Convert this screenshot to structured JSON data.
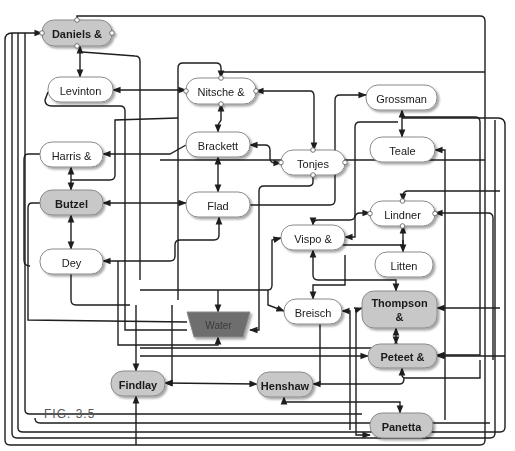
{
  "figure": {
    "caption": "Fig. 3.5",
    "caption_display": "FIG. 3.5"
  },
  "colors": {
    "node_fill_default": "#ffffff",
    "node_fill_highlight": "#c8c8c8",
    "node_fill_water": "#6e6e6e",
    "edge": "#1e1e1e",
    "node_stroke": "#8a8a8a"
  },
  "nodes": [
    {
      "id": "daniels",
      "label": "Daniels &",
      "x": 42,
      "y": 20,
      "w": 70,
      "h": 26,
      "style": "highlight",
      "ports": true
    },
    {
      "id": "levinton",
      "label": "Levinton",
      "x": 48,
      "y": 77,
      "w": 65,
      "h": 25,
      "style": "default"
    },
    {
      "id": "nitsche",
      "label": "Nitsche &",
      "x": 186,
      "y": 78,
      "w": 70,
      "h": 26,
      "style": "default",
      "ports": true
    },
    {
      "id": "grossman",
      "label": "Grossman",
      "x": 366,
      "y": 85,
      "w": 71,
      "h": 25,
      "style": "default"
    },
    {
      "id": "harris",
      "label": "Harris &",
      "x": 40,
      "y": 142,
      "w": 63,
      "h": 25,
      "style": "default"
    },
    {
      "id": "brackett",
      "label": "Brackett",
      "x": 186,
      "y": 132,
      "w": 64,
      "h": 25,
      "style": "default"
    },
    {
      "id": "tonjes",
      "label": "Tonjes",
      "x": 281,
      "y": 150,
      "w": 64,
      "h": 25,
      "style": "default",
      "ports": true
    },
    {
      "id": "teale",
      "label": "Teale",
      "x": 370,
      "y": 137,
      "w": 65,
      "h": 25,
      "style": "default"
    },
    {
      "id": "butzel",
      "label": "Butzel",
      "x": 40,
      "y": 190,
      "w": 63,
      "h": 25,
      "style": "highlight"
    },
    {
      "id": "flad",
      "label": "Flad",
      "x": 186,
      "y": 192,
      "w": 64,
      "h": 25,
      "style": "default"
    },
    {
      "id": "lindner",
      "label": "Lindner",
      "x": 370,
      "y": 201,
      "w": 65,
      "h": 25,
      "style": "default",
      "ports": true
    },
    {
      "id": "vispo",
      "label": "Vispo &",
      "x": 281,
      "y": 225,
      "w": 64,
      "h": 25,
      "style": "default"
    },
    {
      "id": "dey",
      "label": "Dey",
      "x": 40,
      "y": 249,
      "w": 63,
      "h": 25,
      "style": "default"
    },
    {
      "id": "litten",
      "label": "Litten",
      "x": 375,
      "y": 252,
      "w": 58,
      "h": 25,
      "style": "default"
    },
    {
      "id": "water",
      "label": "Water",
      "x": 187,
      "y": 312,
      "w": 63,
      "h": 25,
      "style": "water",
      "shape": "trapezoid"
    },
    {
      "id": "breisch",
      "label": "Breisch",
      "x": 284,
      "y": 299,
      "w": 58,
      "h": 25,
      "style": "default"
    },
    {
      "id": "thompson",
      "label": "Thompson",
      "label2": "&",
      "x": 362,
      "y": 291,
      "w": 75,
      "h": 37,
      "style": "highlight"
    },
    {
      "id": "peteet",
      "label": "Peteet &",
      "x": 368,
      "y": 344,
      "w": 69,
      "h": 24,
      "style": "highlight"
    },
    {
      "id": "findlay",
      "label": "Findlay",
      "x": 111,
      "y": 371,
      "w": 54,
      "h": 25,
      "style": "highlight"
    },
    {
      "id": "henshaw",
      "label": "Henshaw",
      "x": 257,
      "y": 372,
      "w": 56,
      "h": 25,
      "style": "highlight"
    },
    {
      "id": "panetta",
      "label": "Panetta",
      "x": 370,
      "y": 413,
      "w": 63,
      "h": 25,
      "style": "highlight"
    }
  ],
  "edges": [
    {
      "from": "daniels",
      "to": "levinton",
      "bidirectional": true
    },
    {
      "from": "levinton",
      "to": "nitsche",
      "bidirectional": true
    },
    {
      "from": "nitsche",
      "to": "brackett",
      "bidirectional": true
    },
    {
      "from": "nitsche",
      "to": "tonjes",
      "bidirectional": true
    },
    {
      "from": "brackett",
      "to": "flad",
      "bidirectional": true
    },
    {
      "from": "brackett",
      "to": "tonjes",
      "bidirectional": false
    },
    {
      "from": "harris",
      "to": "butzel",
      "bidirectional": true
    },
    {
      "from": "butzel",
      "to": "dey",
      "bidirectional": true
    },
    {
      "from": "butzel",
      "to": "flad",
      "bidirectional": true
    },
    {
      "from": "grossman",
      "to": "teale",
      "bidirectional": true
    },
    {
      "from": "lindner",
      "to": "litten",
      "bidirectional": true
    },
    {
      "from": "lindner",
      "to": "vispo",
      "bidirectional": true
    },
    {
      "from": "thompson",
      "to": "peteet",
      "bidirectional": true
    },
    {
      "from": "findlay",
      "to": "henshaw",
      "bidirectional": true
    },
    {
      "from": "henshaw",
      "to": "panetta",
      "bidirectional": false
    },
    {
      "from": "dey",
      "to": "water",
      "bidirectional": false
    },
    {
      "from": "flad",
      "to": "water",
      "bidirectional": false
    }
  ]
}
